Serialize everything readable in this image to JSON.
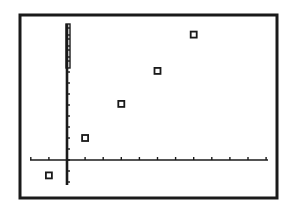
{
  "chart_data": {
    "type": "scatter",
    "title": "",
    "xlabel": "",
    "ylabel": "",
    "marker": "hollow-square",
    "grid": false,
    "legend": null,
    "x_tick_spacing": 1,
    "y_tick_spacing": 1,
    "xlim": [
      -2,
      11
    ],
    "ylim": [
      -2.5,
      12.5
    ],
    "points": [
      {
        "x": -1,
        "y": -1.4
      },
      {
        "x": 1,
        "y": 2
      },
      {
        "x": 3,
        "y": 5.1
      },
      {
        "x": 5,
        "y": 8.1
      },
      {
        "x": 7,
        "y": 11.4
      }
    ]
  },
  "display": {
    "frame_color": "#1a1a1a",
    "axis_color": "#1a1a1a",
    "marker_color": "#1a1a1a",
    "background_color": "#ffffff"
  }
}
